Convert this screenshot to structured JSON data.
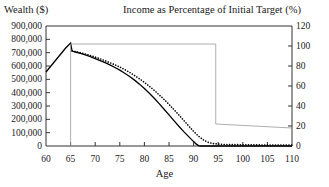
{
  "chart_data": {
    "type": "line",
    "title": "",
    "xlabel": "Age",
    "ylabel": "Wealth ($)",
    "ylabel_right": "Income as Percentage of Initial Target (%)",
    "xlim": [
      60,
      110
    ],
    "ylim": [
      0,
      900000
    ],
    "ylim_right": [
      0,
      120
    ],
    "xticks": [
      60,
      65,
      70,
      75,
      80,
      85,
      90,
      95,
      100,
      105,
      110
    ],
    "xtick_labels": [
      "60",
      "65",
      "70",
      "75",
      "80",
      "85",
      "90",
      "95",
      "100",
      "105",
      "110"
    ],
    "yticks": [
      0,
      100000,
      200000,
      300000,
      400000,
      500000,
      600000,
      700000,
      800000,
      900000
    ],
    "ytick_labels": [
      "0",
      "100,000",
      "200,000",
      "300,000",
      "400,000",
      "500,000",
      "600,000",
      "700,000",
      "800,000",
      "900,000"
    ],
    "yticks_right": [
      0,
      20,
      40,
      60,
      80,
      100,
      120
    ],
    "ytick_labels_right": [
      "0",
      "20",
      "40",
      "60",
      "80",
      "100",
      "120"
    ],
    "grid": false,
    "legend": "none",
    "series": [
      {
        "name": "Wealth (solid)",
        "axis": "left",
        "style": "solid",
        "color": "#000000",
        "x": [
          60,
          61,
          62,
          63,
          64,
          65,
          65.3,
          66,
          67,
          68,
          69,
          70,
          71,
          72,
          73,
          74,
          75,
          76,
          77,
          78,
          79,
          80,
          81,
          82,
          83,
          84,
          85,
          86,
          87,
          88,
          89,
          90,
          90.5,
          91,
          91.3,
          92,
          95,
          100,
          105,
          110
        ],
        "y": [
          555000,
          600000,
          645000,
          690000,
          735000,
          772000,
          712000,
          705000,
          695000,
          683000,
          670000,
          656000,
          641000,
          625000,
          608000,
          589000,
          569000,
          546000,
          521000,
          494000,
          464000,
          431000,
          396000,
          358000,
          318000,
          276000,
          233000,
          190000,
          148000,
          108000,
          70000,
          33000,
          16000,
          3000,
          0,
          0,
          0,
          0,
          0,
          0
        ]
      },
      {
        "name": "Wealth (dotted)",
        "axis": "left",
        "style": "dotted",
        "color": "#000000",
        "x": [
          65.3,
          66,
          67,
          68,
          69,
          70,
          71,
          72,
          73,
          74,
          75,
          76,
          77,
          78,
          79,
          80,
          81,
          82,
          83,
          84,
          85,
          86,
          87,
          88,
          89,
          90,
          91,
          92,
          93,
          94,
          95,
          96,
          97,
          98,
          99,
          100,
          102,
          104,
          106,
          108,
          110
        ],
        "y": [
          712000,
          707000,
          700000,
          690000,
          679000,
          667000,
          654000,
          640000,
          625000,
          609000,
          592000,
          573000,
          552000,
          529000,
          504000,
          477000,
          448000,
          417000,
          384000,
          349000,
          312000,
          273000,
          233000,
          192000,
          150000,
          110000,
          74000,
          45000,
          27000,
          18000,
          14000,
          12000,
          11000,
          10000,
          10000,
          9000,
          8500,
          8000,
          7500,
          7000,
          6500
        ]
      },
      {
        "name": "Income as Percentage of Initial Target (step)",
        "axis": "right",
        "style": "solid-thin",
        "color": "#9a9a9a",
        "x": [
          65,
          65,
          94.5,
          94.5,
          110
        ],
        "y": [
          0,
          102,
          102,
          22,
          18
        ]
      }
    ],
    "annotations": [
      {
        "text": "Income step drops from 102% to 22% at age 94.5"
      },
      {
        "text": "Wealth peaks at approximately 772,000 at age 65"
      },
      {
        "text": "Solid wealth curve reaches 0 at approximately age 91"
      }
    ]
  },
  "labels": {
    "left_axis_title": "Wealth ($)",
    "right_axis_title": "Income as Percentage of Initial Target (%)",
    "x_axis_title": "Age"
  }
}
